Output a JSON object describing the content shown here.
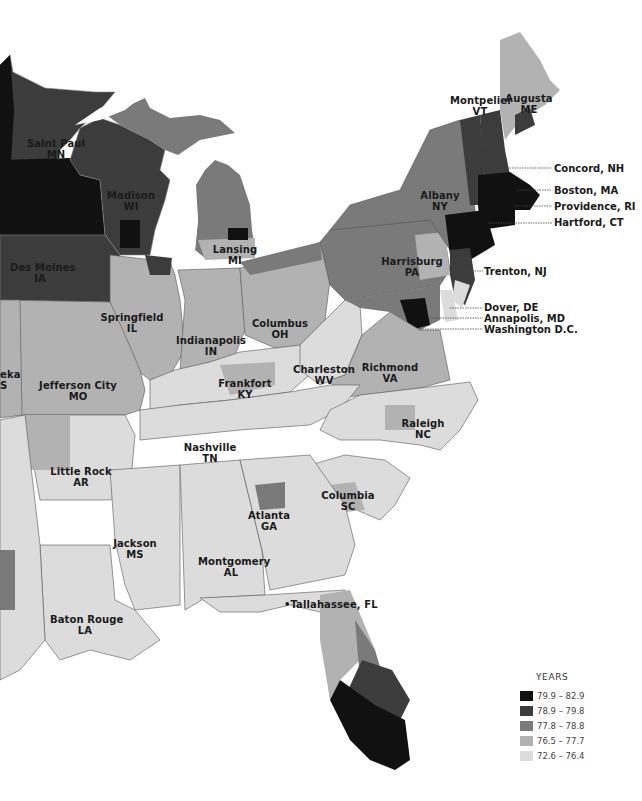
{
  "legend": {
    "title": "YEARS",
    "items": [
      {
        "range": "79.9 – 82.9",
        "color": "#111111"
      },
      {
        "range": "78.9 – 79.8",
        "color": "#3c3c3c"
      },
      {
        "range": "77.8 – 78.8",
        "color": "#7a7a7a"
      },
      {
        "range": "76.5 – 77.7",
        "color": "#b2b2b2"
      },
      {
        "range": "72.6 – 76.4",
        "color": "#dcdcdc"
      }
    ]
  },
  "capitals": {
    "saint_paul": {
      "city": "Saint Paul",
      "state": "MN"
    },
    "madison": {
      "city": "Madison",
      "state": "WI"
    },
    "des_moines": {
      "city": "Des Moines",
      "state": "IA"
    },
    "lansing": {
      "city": "Lansing",
      "state": "MI"
    },
    "springfield": {
      "city": "Springfield",
      "state": "IL"
    },
    "indianapolis": {
      "city": "Indianapolis",
      "state": "IN"
    },
    "columbus": {
      "city": "Columbus",
      "state": "OH"
    },
    "jefferson_city": {
      "city": "Jefferson City",
      "state": "MO"
    },
    "topeka_partial": {
      "city": "eka",
      "state": "S"
    },
    "frankfort": {
      "city": "Frankfort",
      "state": "KY"
    },
    "charleston": {
      "city": "Charleston",
      "state": "WV"
    },
    "richmond": {
      "city": "Richmond",
      "state": "VA"
    },
    "harrisburg": {
      "city": "Harrisburg",
      "state": "PA"
    },
    "albany": {
      "city": "Albany",
      "state": "NY"
    },
    "montpelier": {
      "city": "Montpelier",
      "state": "VT"
    },
    "augusta": {
      "city": "Augusta",
      "state": "ME"
    },
    "raleigh": {
      "city": "Raleigh",
      "state": "NC"
    },
    "nashville": {
      "city": "Nashville",
      "state": "TN"
    },
    "little_rock": {
      "city": "Little Rock",
      "state": "AR"
    },
    "columbia": {
      "city": "Columbia",
      "state": "SC"
    },
    "atlanta": {
      "city": "Atlanta",
      "state": "GA"
    },
    "jackson": {
      "city": "Jackson",
      "state": "MS"
    },
    "montgomery": {
      "city": "Montgomery",
      "state": "AL"
    },
    "baton_rouge": {
      "city": "Baton Rouge",
      "state": "LA"
    },
    "tallahassee": {
      "label": "•Tallahassee, FL"
    }
  },
  "callouts": {
    "concord": "Concord, NH",
    "boston": "Boston, MA",
    "providence": "Providence, RI",
    "hartford": "Hartford, CT",
    "trenton": "Trenton, NJ",
    "dover": "Dover, DE",
    "annapolis": "Annapolis, MD",
    "washington": "Washington D.C."
  },
  "colors": {
    "c1": "#111111",
    "c2": "#3c3c3c",
    "c3": "#7a7a7a",
    "c4": "#b2b2b2",
    "c5": "#dcdcdc",
    "border": "#555555",
    "inner_border": "#e8e8e8",
    "water": "#ffffff"
  }
}
